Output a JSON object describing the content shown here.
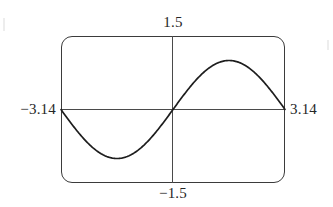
{
  "figure": {
    "kind": "graphing-calculator-screen"
  },
  "labels": {
    "y_max": "1.5",
    "y_min": "−1.5",
    "x_min": "−3.14",
    "x_max": "3.14"
  },
  "colors": {
    "frame": "#3b3b3b",
    "axis": "#4a4a4a",
    "curve": "#1d1d1d",
    "text": "#262626",
    "background": "#ffffff"
  },
  "chart_data": {
    "type": "line",
    "title": "",
    "xlabel": "",
    "ylabel": "",
    "xlim": [
      -3.14,
      3.14
    ],
    "ylim": [
      -1.5,
      1.5
    ],
    "grid": false,
    "legend": null,
    "xtick_labels": [
      "−3.14",
      "3.14"
    ],
    "ytick_labels": [
      "−1.5",
      "1.5"
    ],
    "series": [
      {
        "name": "y = sin(x)",
        "x": [
          -3.14,
          -2.83,
          -2.51,
          -2.2,
          -1.88,
          -1.57,
          -1.26,
          -0.94,
          -0.63,
          -0.31,
          0.0,
          0.31,
          0.63,
          0.94,
          1.26,
          1.57,
          1.88,
          2.2,
          2.51,
          2.83,
          3.14
        ],
        "values": [
          0.0,
          -0.31,
          -0.59,
          -0.81,
          -0.95,
          -1.0,
          -0.95,
          -0.81,
          -0.59,
          -0.31,
          0.0,
          0.31,
          0.59,
          0.81,
          0.95,
          1.0,
          0.95,
          0.81,
          0.59,
          0.31,
          0.0
        ]
      }
    ],
    "annotations": [
      {
        "text": "minimum",
        "x": -1.57,
        "y": -1.0
      },
      {
        "text": "maximum",
        "x": 1.57,
        "y": 1.0
      }
    ]
  }
}
